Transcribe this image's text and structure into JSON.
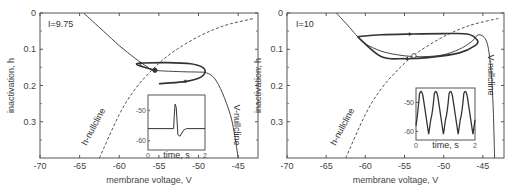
{
  "chart_data": [
    {
      "type": "line",
      "panel": "left",
      "annotation": "I=9.75",
      "xlabel": "membrane voltage, V",
      "ylabel": "inactivation, h",
      "xlim": [
        -70,
        -42.5
      ],
      "ylim": [
        0,
        0.4
      ],
      "y_inverted": true,
      "xticks": [
        -70,
        -65,
        -60,
        -55,
        -50,
        -45
      ],
      "yticks": [
        0,
        0.1,
        0.2,
        0.3
      ],
      "ytick_labels": [
        "0",
        "0.1",
        "0.2",
        "0.3"
      ],
      "series": [
        {
          "name": "V-nullcline",
          "style": "solid",
          "label": "V-nullcline",
          "x": [
            -64.5,
            -62,
            -60,
            -58,
            -56.5,
            -55.5,
            -52,
            -50,
            -49,
            -48,
            -47,
            -46,
            -45.5,
            -45
          ],
          "y": [
            0,
            0.05,
            0.09,
            0.125,
            0.148,
            0.158,
            0.162,
            0.163,
            0.165,
            0.18,
            0.22,
            0.28,
            0.33,
            0.4
          ]
        },
        {
          "name": "h-nullcline",
          "style": "dashed",
          "label": "h-nullcline",
          "x": [
            -62.5,
            -60,
            -58,
            -56,
            -54,
            -52,
            -50,
            -48,
            -46,
            -43
          ],
          "y": [
            0.4,
            0.28,
            0.21,
            0.16,
            0.12,
            0.09,
            0.065,
            0.045,
            0.03,
            0.015
          ]
        },
        {
          "name": "trajectory",
          "style": "solid-bold",
          "x": [
            -55.5,
            -56.5,
            -57.5,
            -57.8,
            -57,
            -54,
            -51,
            -49.5,
            -49.2,
            -50,
            -52,
            -55
          ],
          "y": [
            0.158,
            0.152,
            0.145,
            0.14,
            0.138,
            0.137,
            0.14,
            0.15,
            0.165,
            0.18,
            0.19,
            0.195
          ]
        }
      ],
      "fixed_point": {
        "x": -55.5,
        "y": 0.158,
        "type": "filled"
      },
      "inset": {
        "xlabel": "time, s",
        "xticks": [
          "0",
          "2"
        ],
        "yticks": [
          "-50",
          "-60"
        ],
        "description": "single spike then return to rest near -56"
      }
    },
    {
      "type": "line",
      "panel": "right",
      "annotation": "I=10",
      "xlabel": "membrane voltage, V",
      "ylabel": "inactivation, h",
      "xlim": [
        -70,
        -42.3
      ],
      "ylim": [
        0,
        0.4
      ],
      "y_inverted": true,
      "xticks": [
        -70,
        -65,
        -60,
        -55,
        -50,
        -45
      ],
      "yticks": [
        0,
        0.1,
        0.2,
        0.3
      ],
      "ytick_labels": [
        "0",
        "0.1",
        "0.2",
        "0.3"
      ],
      "series": [
        {
          "name": "V-nullcline",
          "style": "solid",
          "label": "V-nullcline",
          "x": [
            -63.7,
            -62,
            -61,
            -60,
            -58,
            -56,
            -54,
            -52,
            -50,
            -48,
            -46.5,
            -45.5,
            -44.5,
            -44,
            -43.7,
            -43.5
          ],
          "y": [
            0,
            0.04,
            0.065,
            0.085,
            0.105,
            0.115,
            0.12,
            0.12,
            0.115,
            0.1,
            0.08,
            0.06,
            0.08,
            0.15,
            0.25,
            0.4
          ]
        },
        {
          "name": "h-nullcline",
          "style": "dashed",
          "label": "h-nullcline",
          "x": [
            -62.5,
            -60,
            -58,
            -56,
            -54,
            -52,
            -50,
            -48,
            -46,
            -43
          ],
          "y": [
            0.4,
            0.28,
            0.21,
            0.16,
            0.12,
            0.09,
            0.065,
            0.045,
            0.03,
            0.015
          ]
        },
        {
          "name": "limit-cycle",
          "style": "solid-bold",
          "x": [
            -61,
            -58,
            -54,
            -50,
            -47,
            -45.7,
            -46,
            -48,
            -52,
            -55,
            -58,
            -61
          ],
          "y": [
            0.065,
            0.06,
            0.058,
            0.057,
            0.058,
            0.075,
            0.09,
            0.11,
            0.123,
            0.126,
            0.12,
            0.065
          ]
        }
      ],
      "fixed_point": {
        "x": -53.8,
        "y": 0.118,
        "type": "open"
      },
      "inset": {
        "xlabel": "time, s",
        "xticks": [
          "0",
          "2"
        ],
        "yticks": [
          "-50",
          "-60"
        ],
        "description": "periodic spiking, 4 cycles"
      }
    }
  ]
}
